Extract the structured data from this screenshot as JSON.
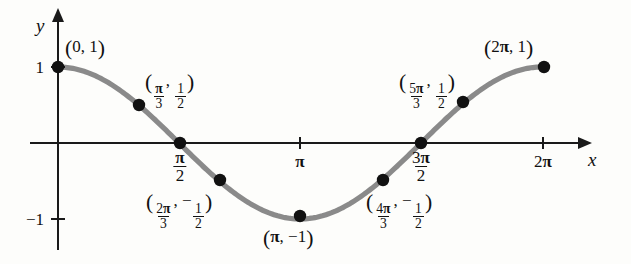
{
  "figure": {
    "kind": "cosine-graph",
    "title": "",
    "curve_color": "#8a8a8a",
    "axis_color": "#1a1a1a",
    "point_color": "#111111",
    "background": "#fdfdfb"
  },
  "axes": {
    "x_label": "x",
    "y_label": "y",
    "x_ticks": [
      {
        "label_plain": "π/2",
        "type": "fraction",
        "num": "π",
        "den": "2",
        "x": 1.5708
      },
      {
        "label_plain": "π",
        "type": "plain",
        "text": "π",
        "x": 3.1416
      },
      {
        "label_plain": "3π/2",
        "type": "fraction",
        "num": "3π",
        "den": "2",
        "x": 4.7124
      },
      {
        "label_plain": "2π",
        "type": "plain",
        "text": "2π",
        "x": 6.2832
      }
    ],
    "y_ticks": [
      {
        "label": "1",
        "y": 1
      },
      {
        "label": "−1",
        "y": -1
      }
    ],
    "xlim": [
      -0.12,
      6.78
    ],
    "ylim": [
      -1.65,
      1.45
    ]
  },
  "chart_data": {
    "type": "line",
    "title": "",
    "xlabel": "x",
    "ylabel": "y",
    "function": "y = cos x",
    "xlim": [
      0,
      6.2832
    ],
    "ylim": [
      -1,
      1
    ],
    "grid": false,
    "legend": "none",
    "x": [
      0,
      1.0472,
      1.5708,
      2.0944,
      3.1416,
      4.1888,
      4.7124,
      5.236,
      6.2832
    ],
    "values": [
      1,
      0.5,
      0,
      -0.5,
      -1,
      -0.5,
      0,
      0.5,
      1
    ],
    "points": [
      {
        "x": 0,
        "y": 1,
        "label_kind": "pair-plain",
        "label_plain": "(0, 1)",
        "px": 58,
        "py": 67,
        "lbl_x": 65,
        "lbl_y": 38
      },
      {
        "x": 1.0472,
        "y": 0.5,
        "label_kind": "pair-fraction",
        "label_plain": "(π/3, 1/2)",
        "x_num": "π",
        "x_den": "3",
        "y_sign": "",
        "y_num": "1",
        "y_den": "2",
        "px": 139,
        "py": 105,
        "lbl_x": 145,
        "lbl_y": 72
      },
      {
        "x": 1.5708,
        "y": 0,
        "label_kind": "none",
        "label_plain": "",
        "px": 180,
        "py": 143
      },
      {
        "x": 2.0944,
        "y": -0.5,
        "label_kind": "pair-fraction",
        "label_plain": "(2π/3, −1/2)",
        "x_num": "2π",
        "x_den": "3",
        "y_sign": "−",
        "y_num": "1",
        "y_den": "2",
        "px": 220,
        "py": 180,
        "lbl_x": 146,
        "lbl_y": 192
      },
      {
        "x": 3.1416,
        "y": -1,
        "label_kind": "pair-plain",
        "label_plain": "(π, −1)",
        "px": 300,
        "py": 216,
        "lbl_x": 263,
        "lbl_y": 228
      },
      {
        "x": 4.1888,
        "y": -0.5,
        "label_kind": "pair-fraction",
        "label_plain": "(4π/3, −1/2)",
        "x_num": "4π",
        "x_den": "3",
        "y_sign": "−",
        "y_num": "1",
        "y_den": "2",
        "px": 383,
        "py": 180,
        "lbl_x": 366,
        "lbl_y": 192
      },
      {
        "x": 4.7124,
        "y": 0,
        "label_kind": "none",
        "label_plain": "",
        "px": 421,
        "py": 143
      },
      {
        "x": 5.236,
        "y": 0.5,
        "label_kind": "pair-fraction",
        "label_plain": "(5π/3, 1/2)",
        "x_num": "5π",
        "x_den": "3",
        "y_sign": "",
        "y_num": "1",
        "y_den": "2",
        "px": 463,
        "py": 102,
        "lbl_x": 399,
        "lbl_y": 72
      },
      {
        "x": 6.2832,
        "y": 1,
        "label_kind": "pair-plain",
        "label_plain": "(2π, 1)",
        "px": 544,
        "py": 67,
        "lbl_x": 484,
        "lbl_y": 38
      }
    ]
  },
  "geometry": {
    "origin_px": {
      "x": 58,
      "y": 143
    },
    "unit_x_px": 77.04,
    "unit_y_px": 76,
    "x_axis": {
      "x1": 30,
      "x2": 582,
      "y": 143
    },
    "y_axis": {
      "x": 58,
      "y1": 18,
      "y2": 250
    },
    "x_axis_label_pos": {
      "x": 588,
      "y": 150
    },
    "y_axis_label_pos": {
      "x": 36,
      "y": 16
    },
    "tick_positions": {
      "pi_over_2": 180,
      "pi": 300,
      "three_pi_over_2": 421,
      "two_pi": 543,
      "y_one": 67,
      "y_neg_one": 219
    }
  }
}
